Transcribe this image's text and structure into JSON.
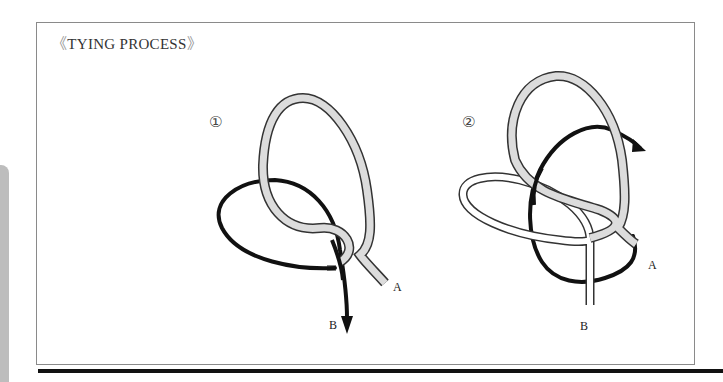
{
  "title": {
    "open_bracket": "《",
    "text": "TYING PROCESS",
    "close_bracket": "》"
  },
  "steps": [
    {
      "number": "①",
      "labels": {
        "a": "A",
        "b": "B"
      }
    },
    {
      "number": "②",
      "labels": {
        "a": "A",
        "b": "B"
      }
    }
  ],
  "colors": {
    "rope_gray": "#dcdcdc",
    "rope_outline": "#333333",
    "rope_black": "#111111",
    "frame": "#8a8a8a",
    "side_tab": "#bdbdbd"
  }
}
